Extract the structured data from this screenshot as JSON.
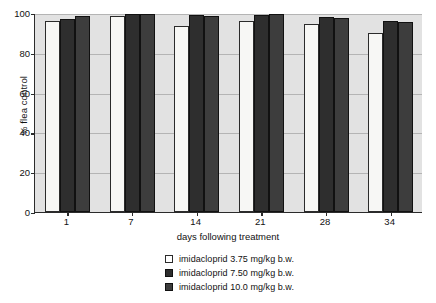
{
  "chart_data": {
    "type": "bar",
    "title": "",
    "subtitle": "",
    "xlabel": "days following treatment",
    "ylabel": "% flea control",
    "categories": [
      "1",
      "7",
      "14",
      "21",
      "28",
      "34"
    ],
    "series": [
      {
        "name": "imidacloprid 3.75 mg/kg b.w.",
        "color": "#f7f7f5",
        "values": [
          96,
          98.5,
          93.5,
          96,
          94.5,
          90
        ]
      },
      {
        "name": "imidacloprid 7.50 mg/kg b.w.",
        "color": "#2e2e2e",
        "values": [
          97,
          99.5,
          99,
          99,
          98,
          96
        ]
      },
      {
        "name": "imidacloprid 10.0 mg/kg b.w.",
        "color": "#3d3d3d",
        "values": [
          98.5,
          99.5,
          98.5,
          99.5,
          97.5,
          95.5
        ]
      }
    ],
    "ylim": [
      0,
      100
    ],
    "yticks": [
      0,
      20,
      40,
      60,
      80,
      100
    ],
    "ytick_labels": [
      "0",
      "20",
      "40",
      "60",
      "80",
      "100"
    ],
    "grid": true,
    "grid_axis": "y",
    "legend_position": "bottom-center",
    "plot_background": "#e2e2e2",
    "axis_color": "#2b2b2b",
    "gridline_color": "#b4b4b4"
  },
  "legend": {
    "items": [
      {
        "label": "imidacloprid 3.75 mg/kg b.w."
      },
      {
        "label": "imidacloprid 7.50 mg/kg b.w."
      },
      {
        "label": "imidacloprid 10.0 mg/kg b.w."
      }
    ]
  }
}
